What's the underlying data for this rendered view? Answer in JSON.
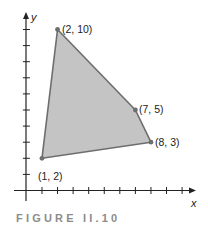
{
  "chart_data": {
    "type": "polygon",
    "title": "",
    "caption": "FIGURE II.10",
    "xlabel": "x",
    "ylabel": "y",
    "xlim": [
      0,
      10
    ],
    "ylim": [
      0,
      10
    ],
    "x_ticks": [
      1,
      2,
      3,
      4,
      5,
      6,
      7,
      8,
      9,
      10
    ],
    "y_ticks": [
      1,
      2,
      3,
      4,
      5,
      6,
      7,
      8,
      9,
      10
    ],
    "tick_labels_shown": false,
    "grid": false,
    "fill_color": "#c4c4c4",
    "edge_color": "#6e6e6e",
    "vertices": [
      {
        "x": 1,
        "y": 2,
        "label": "(1, 2)"
      },
      {
        "x": 2,
        "y": 10,
        "label": "(2, 10)"
      },
      {
        "x": 7,
        "y": 5,
        "label": "(7, 5)"
      },
      {
        "x": 8,
        "y": 3,
        "label": "(8, 3)"
      }
    ]
  },
  "labels": {
    "v1": "(1, 2)",
    "v2": "(2, 10)",
    "v3": "(7, 5)",
    "v4": "(8, 3)",
    "x_axis": "x",
    "y_axis": "y",
    "caption": "FIGURE II.10"
  }
}
